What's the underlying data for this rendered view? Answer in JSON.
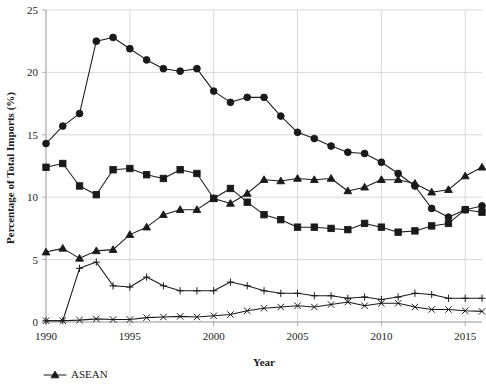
{
  "chart_data": {
    "type": "line",
    "title": "",
    "xlabel": "Year",
    "ylabel": "Percentage of Total Imports (%)",
    "xlim": [
      1990,
      2016
    ],
    "ylim": [
      0,
      25
    ],
    "yticks": [
      0,
      5,
      10,
      15,
      20,
      25
    ],
    "ytick_labels": [
      "0",
      "5",
      "10",
      "15",
      "20",
      "25"
    ],
    "xticks": [
      1990,
      1995,
      2000,
      2005,
      2010,
      2015
    ],
    "xtick_labels": [
      "1990",
      "1995",
      "2000",
      "2005",
      "2010",
      "2015"
    ],
    "grid": true,
    "legend_position": "bottom-left",
    "x": [
      1990,
      1991,
      1992,
      1993,
      1994,
      1995,
      1996,
      1997,
      1998,
      1999,
      2000,
      2001,
      2002,
      2003,
      2004,
      2005,
      2006,
      2007,
      2008,
      2009,
      2010,
      2011,
      2012,
      2013,
      2014,
      2015,
      2016
    ],
    "series": [
      {
        "name": "series-circle",
        "marker": "circle",
        "values": [
          14.3,
          15.7,
          16.7,
          22.5,
          22.8,
          21.9,
          21.0,
          20.3,
          20.1,
          20.3,
          18.5,
          17.6,
          18.0,
          18.0,
          16.5,
          15.2,
          14.7,
          14.1,
          13.6,
          13.5,
          12.8,
          11.9,
          10.9,
          9.1,
          8.4,
          9.0,
          9.3
        ]
      },
      {
        "name": "series-square",
        "marker": "square",
        "values": [
          12.4,
          12.7,
          10.9,
          10.2,
          12.2,
          12.3,
          11.8,
          11.5,
          12.2,
          11.9,
          9.9,
          10.7,
          9.6,
          8.6,
          8.2,
          7.6,
          7.6,
          7.5,
          7.4,
          7.9,
          7.6,
          7.2,
          7.3,
          7.7,
          7.9,
          9.0,
          8.8
        ]
      },
      {
        "name": "series-triangle-ASEAN",
        "marker": "triangle",
        "values": [
          5.6,
          5.9,
          5.1,
          5.7,
          5.8,
          7.0,
          7.6,
          8.6,
          9.0,
          9.0,
          9.9,
          9.5,
          10.3,
          11.4,
          11.3,
          11.5,
          11.4,
          11.5,
          10.5,
          10.8,
          11.4,
          11.4,
          11.1,
          10.4,
          10.6,
          11.7,
          12.4
        ]
      },
      {
        "name": "series-plus",
        "marker": "plus",
        "values": [
          0.1,
          0.1,
          4.3,
          4.8,
          2.9,
          2.8,
          3.6,
          2.9,
          2.5,
          2.5,
          2.5,
          3.2,
          2.9,
          2.5,
          2.3,
          2.3,
          2.1,
          2.1,
          1.9,
          2.0,
          1.8,
          2.0,
          2.3,
          2.2,
          1.9,
          1.9,
          1.9
        ]
      },
      {
        "name": "series-cross",
        "marker": "cross",
        "values": [
          0.1,
          0.1,
          0.15,
          0.25,
          0.2,
          0.2,
          0.35,
          0.4,
          0.45,
          0.4,
          0.5,
          0.6,
          0.9,
          1.1,
          1.2,
          1.3,
          1.2,
          1.4,
          1.6,
          1.3,
          1.5,
          1.5,
          1.2,
          1.0,
          1.0,
          0.9,
          0.85
        ]
      }
    ],
    "legend": [
      {
        "label": "ASEAN",
        "marker": "triangle"
      }
    ],
    "colors": {
      "series": "#1a1a1a",
      "grid": "#c8c8c8",
      "axis": "#9a9a9a",
      "background": "#ffffff"
    }
  }
}
